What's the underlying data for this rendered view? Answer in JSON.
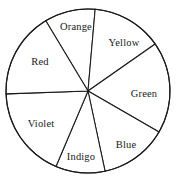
{
  "chart_data": {
    "type": "pie",
    "title": "",
    "subtitle": "",
    "xlabel": "",
    "ylabel": "",
    "legend": "none",
    "grid": false,
    "style": {
      "fill_color": "#ffffff",
      "stroke_color": "#1a1a1a",
      "background": "#ffffff"
    },
    "geometry": {
      "center_x": 88,
      "center_y": 91,
      "radius": 82
    },
    "categories": [
      "Orange",
      "Yellow",
      "Green",
      "Blue",
      "Indigo",
      "Violet",
      "Red"
    ],
    "values": [
      50,
      65,
      48,
      35,
      35,
      65,
      62
    ],
    "slices": [
      {
        "label": "Orange",
        "start_angle": 329,
        "end_angle": 365,
        "sweep": 36,
        "label_x": 76,
        "label_y": 27
      },
      {
        "label": "Yellow",
        "start_angle": 5,
        "end_angle": 55,
        "sweep": 50,
        "label_x": 124,
        "label_y": 43
      },
      {
        "label": "Green",
        "start_angle": 55,
        "end_angle": 120,
        "sweep": 65,
        "label_x": 144,
        "label_y": 94
      },
      {
        "label": "Blue",
        "start_angle": 120,
        "end_angle": 168,
        "sweep": 48,
        "label_x": 126,
        "label_y": 145
      },
      {
        "label": "Indigo",
        "start_angle": 168,
        "end_angle": 203,
        "sweep": 35,
        "label_x": 81,
        "label_y": 157
      },
      {
        "label": "Violet",
        "start_angle": 203,
        "end_angle": 268,
        "sweep": 65,
        "label_x": 41,
        "label_y": 124
      },
      {
        "label": "Red",
        "start_angle": 268,
        "end_angle": 329,
        "sweep": 61,
        "label_x": 40,
        "label_y": 62
      }
    ]
  }
}
